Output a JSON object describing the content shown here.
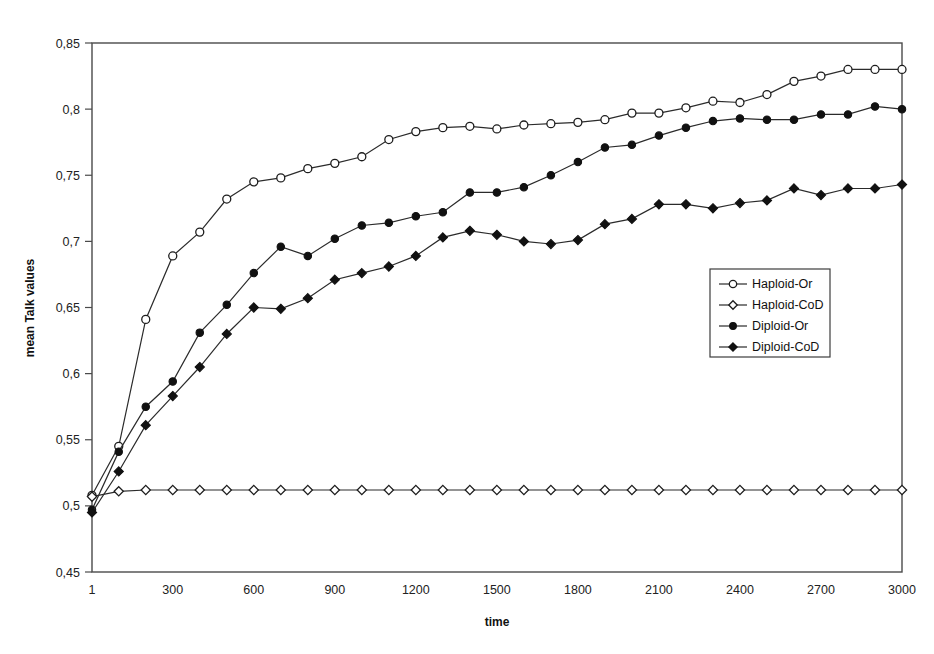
{
  "chart_data": {
    "type": "line",
    "title": "",
    "xlabel": "time",
    "ylabel": "mean Talk values",
    "xlim": [
      1,
      3000
    ],
    "ylim": [
      0.45,
      0.85
    ],
    "grid": false,
    "legend_position": "center-right",
    "decimal_separator": ",",
    "x_tick_labels": [
      "1",
      "300",
      "600",
      "900",
      "1200",
      "1500",
      "1800",
      "2100",
      "2400",
      "2700",
      "3000"
    ],
    "x_tick_values": [
      1,
      300,
      600,
      900,
      1200,
      1500,
      1800,
      2100,
      2400,
      2700,
      3000
    ],
    "y_tick_labels": [
      "0,45",
      "0,5",
      "0,55",
      "0,6",
      "0,65",
      "0,7",
      "0,75",
      "0,8",
      "0,85"
    ],
    "y_tick_values": [
      0.45,
      0.5,
      0.55,
      0.6,
      0.65,
      0.7,
      0.75,
      0.8,
      0.85
    ],
    "x": [
      1,
      100,
      200,
      300,
      400,
      500,
      600,
      700,
      800,
      900,
      1000,
      1100,
      1200,
      1300,
      1400,
      1500,
      1600,
      1700,
      1800,
      1900,
      2000,
      2100,
      2200,
      2300,
      2400,
      2500,
      2600,
      2700,
      2800,
      2900,
      3000
    ],
    "series": [
      {
        "name": "Haploid-Or",
        "marker": "open-circle",
        "values": [
          0.508,
          0.545,
          0.641,
          0.689,
          0.707,
          0.732,
          0.745,
          0.748,
          0.755,
          0.759,
          0.764,
          0.777,
          0.783,
          0.786,
          0.787,
          0.785,
          0.788,
          0.789,
          0.79,
          0.792,
          0.797,
          0.797,
          0.801,
          0.806,
          0.805,
          0.811,
          0.821,
          0.825,
          0.83,
          0.83,
          0.83
        ]
      },
      {
        "name": "Haploid-CoD",
        "marker": "open-diamond",
        "values": [
          0.507,
          0.511,
          0.512,
          0.512,
          0.512,
          0.512,
          0.512,
          0.512,
          0.512,
          0.512,
          0.512,
          0.512,
          0.512,
          0.512,
          0.512,
          0.512,
          0.512,
          0.512,
          0.512,
          0.512,
          0.512,
          0.512,
          0.512,
          0.512,
          0.512,
          0.512,
          0.512,
          0.512,
          0.512,
          0.512,
          0.512
        ]
      },
      {
        "name": "Diploid-Or",
        "marker": "filled-circle",
        "values": [
          0.497,
          0.541,
          0.575,
          0.594,
          0.631,
          0.652,
          0.676,
          0.696,
          0.689,
          0.702,
          0.712,
          0.714,
          0.719,
          0.722,
          0.737,
          0.737,
          0.741,
          0.75,
          0.76,
          0.771,
          0.773,
          0.78,
          0.786,
          0.791,
          0.793,
          0.792,
          0.792,
          0.796,
          0.796,
          0.802,
          0.8
        ]
      },
      {
        "name": "Diploid-CoD",
        "marker": "filled-diamond",
        "values": [
          0.495,
          0.526,
          0.561,
          0.583,
          0.605,
          0.63,
          0.65,
          0.649,
          0.657,
          0.671,
          0.676,
          0.681,
          0.689,
          0.703,
          0.708,
          0.705,
          0.7,
          0.698,
          0.701,
          0.713,
          0.717,
          0.728,
          0.728,
          0.725,
          0.729,
          0.731,
          0.74,
          0.735,
          0.74,
          0.74,
          0.743
        ]
      }
    ]
  },
  "legend": {
    "entries": [
      {
        "label": "Haploid-Or"
      },
      {
        "label": "Haploid-CoD"
      },
      {
        "label": "Diploid-Or"
      },
      {
        "label": "Diploid-CoD"
      }
    ]
  }
}
